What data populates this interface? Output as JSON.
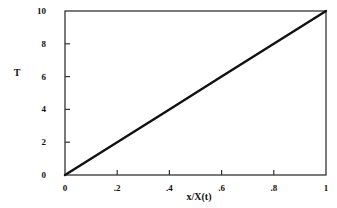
{
  "chart_data": {
    "type": "line",
    "title": "",
    "xlabel": "x/X(t)",
    "ylabel": "T",
    "xlim": [
      0,
      1
    ],
    "ylim": [
      0,
      10
    ],
    "x_ticks": [
      "0",
      ".2",
      ".4",
      ".6",
      ".8",
      "1"
    ],
    "y_ticks": [
      "0",
      "2",
      "4",
      "6",
      "8",
      "10"
    ],
    "grid": false,
    "legend": null,
    "series": [
      {
        "name": "T",
        "x": [
          0,
          0.2,
          0.4,
          0.6,
          0.8,
          1.0
        ],
        "y": [
          0,
          2,
          4,
          6,
          8,
          10
        ]
      }
    ]
  },
  "colors": {
    "line": "#111111",
    "axis": "#333333",
    "background": "#ffffff"
  }
}
